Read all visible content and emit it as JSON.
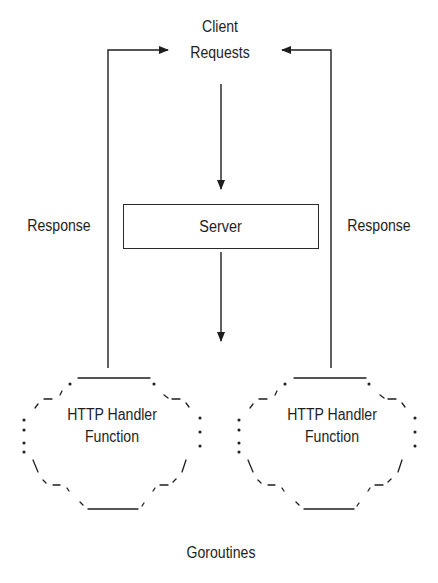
{
  "diagram": {
    "title_node": {
      "line1": "Client",
      "line2": "Requests"
    },
    "server": {
      "label": "Server"
    },
    "edges": {
      "response_left": "Response",
      "response_right": "Response"
    },
    "handlers": [
      {
        "line1": "HTTP Handler",
        "line2": "Function"
      },
      {
        "line1": "HTTP Handler",
        "line2": "Function"
      }
    ],
    "group_label": "Goroutines",
    "colors": {
      "ink": "#1e1e1e",
      "background": "#ffffff"
    }
  }
}
